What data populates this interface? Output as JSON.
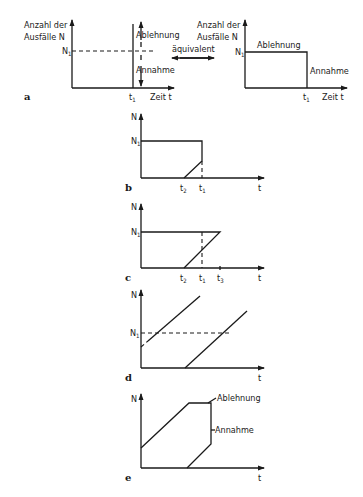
{
  "figure": {
    "panel_a": {
      "label": "a",
      "left": {
        "y_axis_label_line1": "Anzahl der",
        "y_axis_label_line2": "Ausfälle N",
        "n1": "N",
        "n1_sub": "1",
        "t1": "t",
        "t1_sub": "1",
        "x_axis_label": "Zeit t",
        "reject": "Ablehnung",
        "accept": "Annahme"
      },
      "equivalent": "äquivalent",
      "right": {
        "y_axis_label_line1": "Anzahl der",
        "y_axis_label_line2": "Ausfälle N",
        "n1": "N",
        "n1_sub": "1",
        "t1": "t",
        "t1_sub": "1",
        "x_axis_label": "Zeit t",
        "reject": "Ablehnung",
        "accept": "Annahme"
      }
    },
    "panel_b": {
      "label": "b",
      "y": "N",
      "n1": "N",
      "n1_sub": "1",
      "t2": "t",
      "t2_sub": "2",
      "t1": "t",
      "t1_sub": "1",
      "x": "t"
    },
    "panel_c": {
      "label": "c",
      "y": "N",
      "n1": "N",
      "n1_sub": "1",
      "t2": "t",
      "t2_sub": "2",
      "t1": "t",
      "t1_sub": "1",
      "t3": "t",
      "t3_sub": "3",
      "x": "t"
    },
    "panel_d": {
      "label": "d",
      "y": "N",
      "n1": "N",
      "n1_sub": "1",
      "x": "t"
    },
    "panel_e": {
      "label": "e",
      "y": "N",
      "x": "t",
      "reject": "Ablehnung",
      "accept": "Annahme"
    }
  }
}
